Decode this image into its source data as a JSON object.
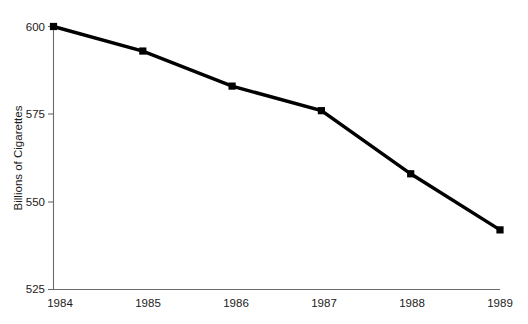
{
  "figure": {
    "background_color": "#ffffff",
    "width": 528,
    "height": 324
  },
  "axes": {
    "y_axis_title": "Billions of Cigarettes",
    "x_axis_title": "",
    "axis_color": "#6b6b6b",
    "y_tick_labels": [
      "600",
      "575",
      "550",
      "525"
    ],
    "x_tick_labels": [
      "1984",
      "1985",
      "1986",
      "1987",
      "1988",
      "1989"
    ]
  },
  "series_style": {
    "line_color": "#000000",
    "marker_color": "#000000",
    "marker_shape": "square"
  },
  "chart_data": {
    "type": "line",
    "title": "",
    "subtitle": "",
    "xlabel": "",
    "ylabel": "Billions of Cigarettes",
    "categories": [
      "1984",
      "1985",
      "1986",
      "1987",
      "1988",
      "1989"
    ],
    "x": [
      1984,
      1985,
      1986,
      1987,
      1988,
      1989
    ],
    "values": [
      600,
      593,
      583,
      576,
      558,
      542
    ],
    "series": [
      {
        "name": "Cigarette Consumption",
        "values": [
          600,
          593,
          583,
          576,
          558,
          542
        ]
      }
    ],
    "ylim": [
      525,
      600
    ],
    "yticks": [
      525,
      550,
      575,
      600
    ],
    "xlim": [
      1984,
      1989
    ],
    "xticks": [
      1984,
      1985,
      1986,
      1987,
      1988,
      1989
    ],
    "grid": false,
    "legend": false,
    "legend_position": "none",
    "annotations": []
  }
}
